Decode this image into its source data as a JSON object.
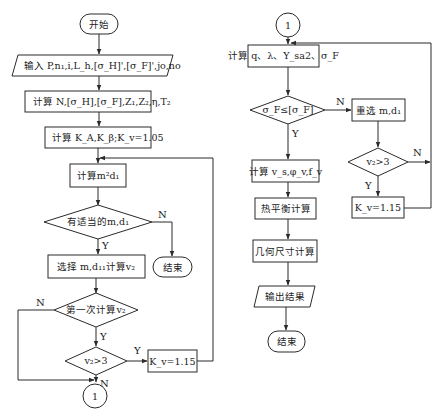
{
  "diagram": {
    "type": "flowchart",
    "left_column": {
      "start": {
        "label": "开始"
      },
      "input": {
        "label": "输入 P,n₁,i,L_h,[σ_H]',[σ_F]',jo,no"
      },
      "calc_n": {
        "label": "计算 N,[σ_H],[σ_F],Z₁,Z₂,η,T₂"
      },
      "calc_k": {
        "label": "计算 K_A,K_β;K_v=1.05"
      },
      "calc_m": {
        "label": "计算m²d₁"
      },
      "decision_suitable": {
        "label": "有适当的m,d₁",
        "yes": "Y",
        "no": "N"
      },
      "end_fail": {
        "label": "结束"
      },
      "select": {
        "label": "选择 m,d₁₁计算v₂"
      },
      "decision_first": {
        "label": "第一次计算v₂",
        "yes": "Y",
        "no": "N"
      },
      "decision_v2": {
        "label": "v₂>3",
        "yes": "Y",
        "no": "N"
      },
      "kv_box": {
        "label": "K_v=1.15"
      },
      "connector": {
        "label": "1"
      }
    },
    "right_column": {
      "connector": {
        "label": "1"
      },
      "calc_q": {
        "label": "计算 q、λ、Y_sa2、σ_F"
      },
      "decision_sigma": {
        "label": "σ_F≤[σ_F]",
        "yes": "Y",
        "no": "N"
      },
      "reselect": {
        "label": "重选 m,d₁"
      },
      "decision_v2": {
        "label": "v₂>3",
        "yes": "Y",
        "no": "N"
      },
      "kv_box": {
        "label": "K_v=1.15"
      },
      "calc_vs": {
        "label": "计算 v_s,φ_v,f_v"
      },
      "heat": {
        "label": "热平衡计算"
      },
      "geometry": {
        "label": "几何尺寸计算"
      },
      "output": {
        "label": "输出结果"
      },
      "end": {
        "label": "结束"
      }
    }
  }
}
